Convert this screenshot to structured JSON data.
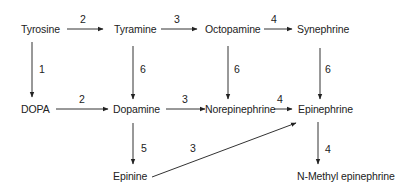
{
  "diagram": {
    "title": "",
    "nodes": [
      {
        "id": "tyrosine",
        "label": "Tyrosine",
        "x": 21,
        "y": 29
      },
      {
        "id": "tyramine",
        "label": "Tyramine",
        "x": 114,
        "y": 29
      },
      {
        "id": "octopamine",
        "label": "Octopamine",
        "x": 205,
        "y": 29
      },
      {
        "id": "synephrine",
        "label": "Synephrine",
        "x": 297,
        "y": 29
      },
      {
        "id": "dopa",
        "label": "DOPA",
        "x": 21,
        "y": 109
      },
      {
        "id": "dopamine",
        "label": "Dopamine",
        "x": 113,
        "y": 109
      },
      {
        "id": "norepinephrine",
        "label": "Norepinephrine",
        "x": 205,
        "y": 109
      },
      {
        "id": "epinephrine",
        "label": "Epinephrine",
        "x": 298,
        "y": 109
      },
      {
        "id": "epinine",
        "label": "Epinine",
        "x": 113,
        "y": 176
      },
      {
        "id": "n_methyl_epinephrine",
        "label": "N-Methyl epinephrine",
        "x": 297,
        "y": 176
      }
    ],
    "edges": [
      {
        "from": "tyrosine",
        "to": "tyramine",
        "label": "2"
      },
      {
        "from": "tyramine",
        "to": "octopamine",
        "label": "3"
      },
      {
        "from": "octopamine",
        "to": "synephrine",
        "label": "4"
      },
      {
        "from": "tyrosine",
        "to": "dopa",
        "label": "1"
      },
      {
        "from": "tyramine",
        "to": "dopamine",
        "label": "6"
      },
      {
        "from": "octopamine",
        "to": "norepinephrine",
        "label": "6"
      },
      {
        "from": "synephrine",
        "to": "epinephrine",
        "label": "6"
      },
      {
        "from": "dopa",
        "to": "dopamine",
        "label": "2"
      },
      {
        "from": "dopamine",
        "to": "norepinephrine",
        "label": "3"
      },
      {
        "from": "norepinephrine",
        "to": "epinephrine",
        "label": "4"
      },
      {
        "from": "dopamine",
        "to": "epinine",
        "label": "5"
      },
      {
        "from": "epinine",
        "to": "epinephrine",
        "label": "3"
      },
      {
        "from": "epinephrine",
        "to": "n_methyl_epinephrine",
        "label": "4"
      }
    ]
  }
}
